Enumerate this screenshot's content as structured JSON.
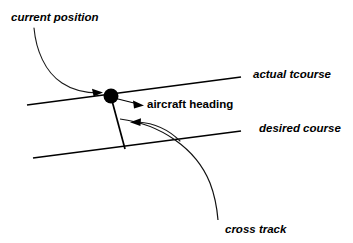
{
  "diagram": {
    "background_color": "#ffffff",
    "stroke_color": "#000000",
    "labels": {
      "current_position": "current position",
      "actual_course": "actual tcourse",
      "aircraft_heading": "aircraft heading",
      "desired_course": "desired course",
      "cross_track": "cross track"
    },
    "elements": {
      "position_dot_name": "current-position-dot",
      "actual_course_line_name": "actual-course-line",
      "desired_course_line_name": "desired-course-line",
      "heading_line_name": "aircraft-heading-line",
      "cross_track_curve_name": "cross-track-curve"
    }
  }
}
